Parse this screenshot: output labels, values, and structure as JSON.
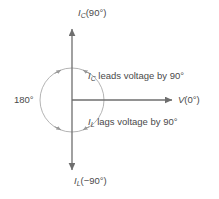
{
  "diagram": {
    "type": "phasor-diagram",
    "title": "",
    "colors": {
      "text": "#4a4a4a",
      "axis": "#6e6e6e",
      "arc": "#a8a8a8",
      "background": "#ffffff"
    },
    "axes": {
      "vertical_up": {
        "symbol": "I",
        "subscript": "C",
        "angle_text": "(90°)"
      },
      "vertical_down": {
        "symbol": "I",
        "subscript": "L",
        "angle_text": "(−90°)"
      },
      "horizontal_right": {
        "symbol": "V",
        "subscript": "",
        "angle_text": "(0°)"
      },
      "horizontal_left": {
        "label": "180°"
      }
    },
    "notes": [
      {
        "symbol": "I",
        "subscript": "C",
        "text": " leads voltage by 90°"
      },
      {
        "symbol": "I",
        "subscript": "L",
        "text": " lags voltage by 90°"
      }
    ]
  }
}
